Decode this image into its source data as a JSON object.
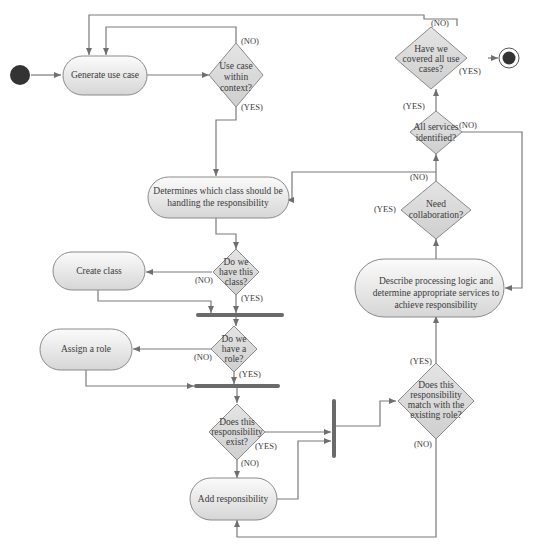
{
  "diagram": {
    "type": "uml-activity-diagram",
    "colors": {
      "line": "#7a7a7a",
      "node_fill_top": "#f8f8f8",
      "node_fill_bottom": "#d8d8d8",
      "decision_fill": "#d6d6d6",
      "terminal": "#333333"
    },
    "nodes": {
      "start": {
        "kind": "initial-node"
      },
      "end": {
        "kind": "final-node"
      },
      "generate_use_case": {
        "label": "Generate use case"
      },
      "use_case_within_context": {
        "lines": [
          "Use case",
          "within",
          "context?"
        ]
      },
      "determines_class": {
        "lines": [
          "Determines which class should be",
          "handling the responsibility"
        ]
      },
      "do_we_have_class": {
        "lines": [
          "Do we",
          "have this",
          "class?"
        ]
      },
      "create_class": {
        "label": "Create class"
      },
      "do_we_have_role": {
        "lines": [
          "Do we",
          "have a",
          "role?"
        ]
      },
      "assign_role": {
        "label": "Assign a role"
      },
      "responsibility_exist": {
        "lines": [
          "Does this",
          "responsibility",
          "exist?"
        ]
      },
      "add_responsibility": {
        "label": "Add responsibility"
      },
      "match_existing_role": {
        "lines": [
          "Does this",
          "responsibility",
          "match with the",
          "existing role?"
        ]
      },
      "describe_processing": {
        "lines": [
          "Describe processing logic and",
          "determine appropriate services to",
          "achieve responsibility"
        ]
      },
      "need_collaboration": {
        "lines": [
          "Need",
          "collaboration?"
        ]
      },
      "all_services_identified": {
        "lines": [
          "All services",
          "identified?"
        ]
      },
      "covered_all_use_cases": {
        "lines": [
          "Have we",
          "covered all use",
          "cases?"
        ]
      }
    },
    "edge_labels": {
      "context_no": "(NO)",
      "context_yes": "(YES)",
      "class_no": "(NO)",
      "class_yes": "(YES)",
      "role_no": "(NO)",
      "role_yes": "(YES)",
      "exist_yes": "(YES)",
      "exist_no": "(NO)",
      "match_yes": "(YES)",
      "match_no": "(NO)",
      "collab_yes": "(YES)",
      "collab_no": "(NO)",
      "services_yes": "(YES)",
      "services_no": "(NO)",
      "covered_yes": "(YES)",
      "covered_no": "(NO)"
    }
  }
}
